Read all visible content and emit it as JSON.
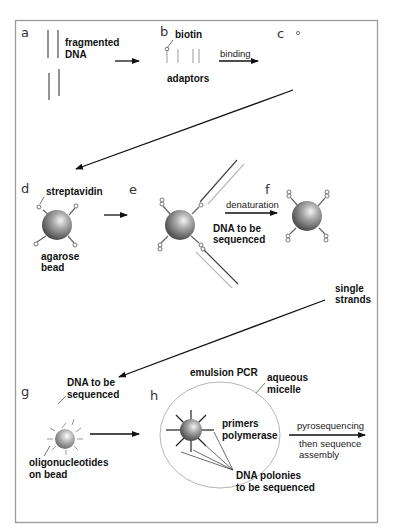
{
  "figure": {
    "frame_color": "#9a9a9a",
    "panels": {
      "a": {
        "letter": "a",
        "label_line1": "fragmented",
        "label_line2": "DNA"
      },
      "b": {
        "letter": "b",
        "biotin": "biotin",
        "adaptors": "adaptors"
      },
      "binding_arrow": {
        "label": "binding"
      },
      "c": {
        "letter": "c"
      },
      "d": {
        "letter": "d",
        "streptavidin": "streptavidin",
        "bead_line1": "agarose",
        "bead_line2": "bead"
      },
      "e": {
        "letter": "e",
        "dna_line1": "DNA to be",
        "dna_line2": "sequenced"
      },
      "f": {
        "letter": "f",
        "arrow_label": "denaturation",
        "strands_line1": "single",
        "strands_line2": "strands"
      },
      "g": {
        "letter": "g",
        "dna_line1": "DNA to be",
        "dna_line2": "sequenced",
        "oligo_line1": "oligonucleotides",
        "oligo_line2": "on bead"
      },
      "h": {
        "letter": "h",
        "title": "emulsion PCR",
        "micelle_line1": "aqueous",
        "micelle_line2": "micelle",
        "primers": "primers",
        "polymerase": "polymerase",
        "polonies_line1": "DNA polonies",
        "polonies_line2": "to be sequenced"
      },
      "final_arrow": {
        "label_top": "pyrosequencing",
        "label_bottom_line1": "then sequence",
        "label_bottom_line2": "assembly"
      }
    }
  }
}
